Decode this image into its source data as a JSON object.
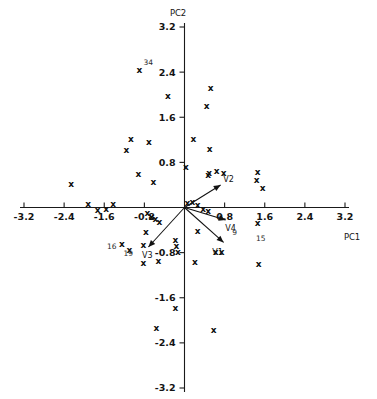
{
  "figure": {
    "kind": "pca-biplot",
    "background": "#ffffff",
    "ink_color": "#111111",
    "marker_glyph": "x"
  },
  "chart_data": {
    "type": "scatter",
    "title": "",
    "subtitle": "",
    "xlabel": "PC1",
    "ylabel": "PC2",
    "xlim": [
      -3.2,
      3.2
    ],
    "ylim": [
      -3.2,
      3.2
    ],
    "grid": false,
    "legend": "none",
    "axes_style": "crossed-at-origin",
    "xticks": [
      -3.2,
      -2.4,
      -1.6,
      -0.8,
      0.8,
      1.6,
      2.4,
      3.2
    ],
    "xtick_labels": [
      "-3.2",
      "-2.4",
      "-1.6",
      "-0.8",
      "0.8",
      "1.6",
      "2.4",
      "3.2"
    ],
    "yticks": [
      -3.2,
      -2.4,
      -1.6,
      -0.8,
      0.8,
      1.6,
      2.4,
      3.2
    ],
    "ytick_labels": [
      "-3.2",
      "-2.4",
      "-1.6",
      "-0.8",
      "0.8",
      "1.6",
      "2.4",
      "3.2"
    ],
    "observations": [
      {
        "x": -0.9,
        "y": 2.44,
        "label": "34"
      },
      {
        "x": -0.33,
        "y": 1.98,
        "label": ""
      },
      {
        "x": 0.52,
        "y": 2.12,
        "label": ""
      },
      {
        "x": 0.44,
        "y": 1.8,
        "label": ""
      },
      {
        "x": -1.07,
        "y": 1.22,
        "label": ""
      },
      {
        "x": -0.71,
        "y": 1.16,
        "label": ""
      },
      {
        "x": -1.16,
        "y": 1.02,
        "label": ""
      },
      {
        "x": 0.18,
        "y": 1.21,
        "label": ""
      },
      {
        "x": 0.5,
        "y": 1.03,
        "label": ""
      },
      {
        "x": 0.03,
        "y": 0.72,
        "label": ""
      },
      {
        "x": -0.92,
        "y": 0.6,
        "label": ""
      },
      {
        "x": -0.62,
        "y": 0.46,
        "label": ""
      },
      {
        "x": 0.47,
        "y": 0.58,
        "label": ""
      },
      {
        "x": 0.49,
        "y": 0.62,
        "label": ""
      },
      {
        "x": 0.64,
        "y": 0.64,
        "label": ""
      },
      {
        "x": 0.78,
        "y": 0.61,
        "label": ""
      },
      {
        "x": 1.46,
        "y": 0.63,
        "label": ""
      },
      {
        "x": 1.44,
        "y": 0.49,
        "label": ""
      },
      {
        "x": 1.56,
        "y": 0.35,
        "label": ""
      },
      {
        "x": -2.26,
        "y": 0.41,
        "label": ""
      },
      {
        "x": 0.06,
        "y": 0.08,
        "label": ""
      },
      {
        "x": 0.16,
        "y": 0.09,
        "label": ""
      },
      {
        "x": 0.26,
        "y": 0.05,
        "label": ""
      },
      {
        "x": 0.37,
        "y": -0.03,
        "label": ""
      },
      {
        "x": 0.47,
        "y": -0.07,
        "label": ""
      },
      {
        "x": -1.92,
        "y": 0.07,
        "label": ""
      },
      {
        "x": -1.73,
        "y": -0.04,
        "label": ""
      },
      {
        "x": -1.56,
        "y": -0.03,
        "label": ""
      },
      {
        "x": -1.42,
        "y": 0.06,
        "label": ""
      },
      {
        "x": -0.74,
        "y": -0.09,
        "label": ""
      },
      {
        "x": -0.66,
        "y": -0.16,
        "label": ""
      },
      {
        "x": -0.58,
        "y": -0.21,
        "label": ""
      },
      {
        "x": -0.5,
        "y": -0.25,
        "label": ""
      },
      {
        "x": 1.46,
        "y": -0.28,
        "label": "15"
      },
      {
        "x": -0.77,
        "y": -0.44,
        "label": ""
      },
      {
        "x": 0.26,
        "y": -0.42,
        "label": ""
      },
      {
        "x": -0.82,
        "y": -0.66,
        "label": ""
      },
      {
        "x": -0.18,
        "y": -0.58,
        "label": ""
      },
      {
        "x": -0.16,
        "y": -0.69,
        "label": ""
      },
      {
        "x": -0.13,
        "y": -0.78,
        "label": ""
      },
      {
        "x": -1.25,
        "y": -0.64,
        "label": "16"
      },
      {
        "x": -1.1,
        "y": -0.76,
        "label": "19"
      },
      {
        "x": 0.62,
        "y": -0.78,
        "label": ""
      },
      {
        "x": 0.74,
        "y": -0.79,
        "label": ""
      },
      {
        "x": -0.82,
        "y": -0.98,
        "label": ""
      },
      {
        "x": -0.52,
        "y": -0.94,
        "label": ""
      },
      {
        "x": 0.21,
        "y": -0.97,
        "label": ""
      },
      {
        "x": 1.48,
        "y": -1.0,
        "label": ""
      },
      {
        "x": -0.18,
        "y": -1.78,
        "label": ""
      },
      {
        "x": -0.56,
        "y": -2.14,
        "label": ""
      },
      {
        "x": 0.58,
        "y": -2.18,
        "label": ""
      }
    ],
    "point_annotations": [
      {
        "label": "34",
        "x": -0.9,
        "y": 2.44
      },
      {
        "label": "16",
        "x": -1.25,
        "y": -0.64
      },
      {
        "label": "19",
        "x": -1.1,
        "y": -0.76
      },
      {
        "label": "9",
        "x": 1.18,
        "y": -0.36
      },
      {
        "label": "15",
        "x": 1.46,
        "y": -0.42
      }
    ],
    "loading_vectors": [
      {
        "name": "V1",
        "x": 0.78,
        "y": -0.62,
        "label_dx": -0.12,
        "label_dy": -0.22
      },
      {
        "name": "V2",
        "x": 0.72,
        "y": 0.4,
        "label_dx": 0.16,
        "label_dy": 0.06
      },
      {
        "name": "V3",
        "x": -0.72,
        "y": -0.7,
        "label_dx": -0.02,
        "label_dy": -0.2
      },
      {
        "name": "V4",
        "x": 0.82,
        "y": -0.22,
        "label_dx": 0.1,
        "label_dy": -0.2
      }
    ]
  },
  "labels": {
    "x_axis_title": "PC1",
    "y_axis_title": "PC2"
  }
}
